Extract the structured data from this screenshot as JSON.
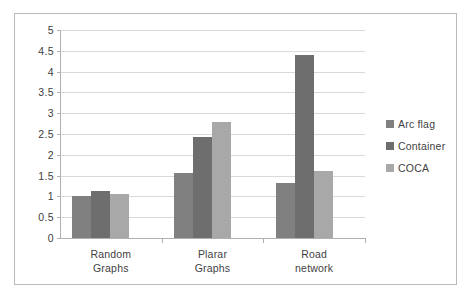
{
  "chart_data": {
    "type": "bar",
    "title": "",
    "subtitle": "",
    "xlabel": "",
    "ylabel": "",
    "ylim": [
      0,
      5
    ],
    "ytick_step": 0.5,
    "yticks": [
      "0",
      "0.5",
      "1",
      "1.5",
      "2",
      "2.5",
      "3",
      "3.5",
      "4",
      "4.5",
      "5"
    ],
    "ytick_values": [
      0,
      0.5,
      1,
      1.5,
      2,
      2.5,
      3,
      3.5,
      4,
      4.5,
      5
    ],
    "grid": true,
    "grid_axis": "y",
    "legend_position": "right",
    "categories": [
      "Random Graphs",
      "Plarar Graphs",
      "Road network"
    ],
    "categories_lines": [
      [
        "Random",
        "Graphs"
      ],
      [
        "Plarar",
        "Graphs"
      ],
      [
        "Road",
        "network"
      ]
    ],
    "series": [
      {
        "name": "Arc flag",
        "color": "#808080",
        "values": [
          1.0,
          1.56,
          1.33
        ]
      },
      {
        "name": "Container",
        "color": "#6e6e6e",
        "values": [
          1.12,
          2.44,
          4.41
        ]
      },
      {
        "name": "COCA",
        "color": "#a8a8a8",
        "values": [
          1.07,
          2.79,
          1.6
        ]
      }
    ]
  },
  "legend": {
    "items": [
      {
        "label": "Arc flag",
        "color": "#808080"
      },
      {
        "label": "Container",
        "color": "#6e6e6e"
      },
      {
        "label": "COCA",
        "color": "#a8a8a8"
      }
    ]
  },
  "colors": {
    "frame": "#b9b9b9",
    "axis": "#b0b0b0",
    "gridline": "#d9d9d9",
    "text": "#3f3f3f",
    "background": "#ffffff"
  }
}
